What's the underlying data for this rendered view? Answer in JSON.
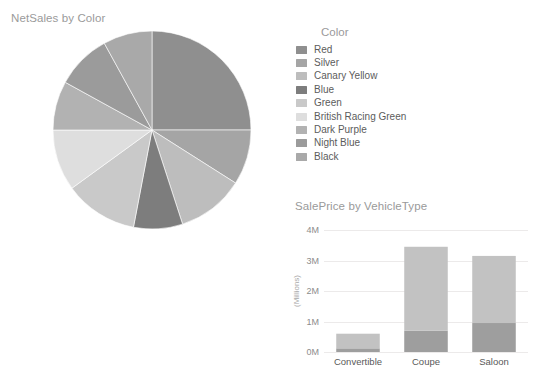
{
  "page": {
    "background": "#ffffff"
  },
  "pie_visual": {
    "title": "NetSales by Color"
  },
  "legend": {
    "title": "Color",
    "items": [
      {
        "label": "Red",
        "color": "#8f8f8f"
      },
      {
        "label": "Silver",
        "color": "#a5a5a5"
      },
      {
        "label": "Canary Yellow",
        "color": "#bdbdbd"
      },
      {
        "label": "Blue",
        "color": "#7d7d7d"
      },
      {
        "label": "Green",
        "color": "#c9c9c9"
      },
      {
        "label": "British Racing Green",
        "color": "#dedede"
      },
      {
        "label": "Dark Purple",
        "color": "#b2b2b2"
      },
      {
        "label": "Night Blue",
        "color": "#9b9b9b"
      },
      {
        "label": "Black",
        "color": "#a9a9a9"
      }
    ]
  },
  "bar_visual": {
    "title": "SalePrice by VehicleType"
  },
  "chart_data": [
    {
      "type": "pie",
      "title": "NetSales by Color",
      "legend_title": "Color",
      "legend_position": "right",
      "labels": [
        "Red",
        "Silver",
        "Canary Yellow",
        "Blue",
        "Green",
        "British Racing Green",
        "Dark Purple",
        "Night Blue",
        "Black"
      ],
      "values": [
        25,
        9,
        11,
        8,
        12,
        10,
        8,
        9,
        8
      ],
      "units": "percent",
      "start_angle": 0,
      "direction": "clockwise",
      "colors": [
        "#8f8f8f",
        "#a5a5a5",
        "#bdbdbd",
        "#7d7d7d",
        "#c9c9c9",
        "#dedede",
        "#b2b2b2",
        "#9b9b9b",
        "#a9a9a9"
      ]
    },
    {
      "type": "bar",
      "subtype": "stacked",
      "title": "SalePrice by VehicleType",
      "xlabel": "",
      "ylabel": "(Millions)",
      "categories": [
        "Convertible",
        "Coupe",
        "Saloon"
      ],
      "ytick_labels": [
        "0M",
        "1M",
        "2M",
        "3M",
        "4M"
      ],
      "ytick_values": [
        0,
        1,
        2,
        3,
        4
      ],
      "ylim": [
        0,
        4
      ],
      "grid": true,
      "legend_position": "none",
      "series": [
        {
          "name": "lower",
          "values": [
            0.12,
            0.7,
            0.95
          ],
          "color": "#9e9e9e"
        },
        {
          "name": "upper",
          "values": [
            0.48,
            2.75,
            2.2
          ],
          "color": "#c2c2c2"
        }
      ],
      "totals": [
        0.6,
        3.45,
        3.15
      ]
    }
  ]
}
